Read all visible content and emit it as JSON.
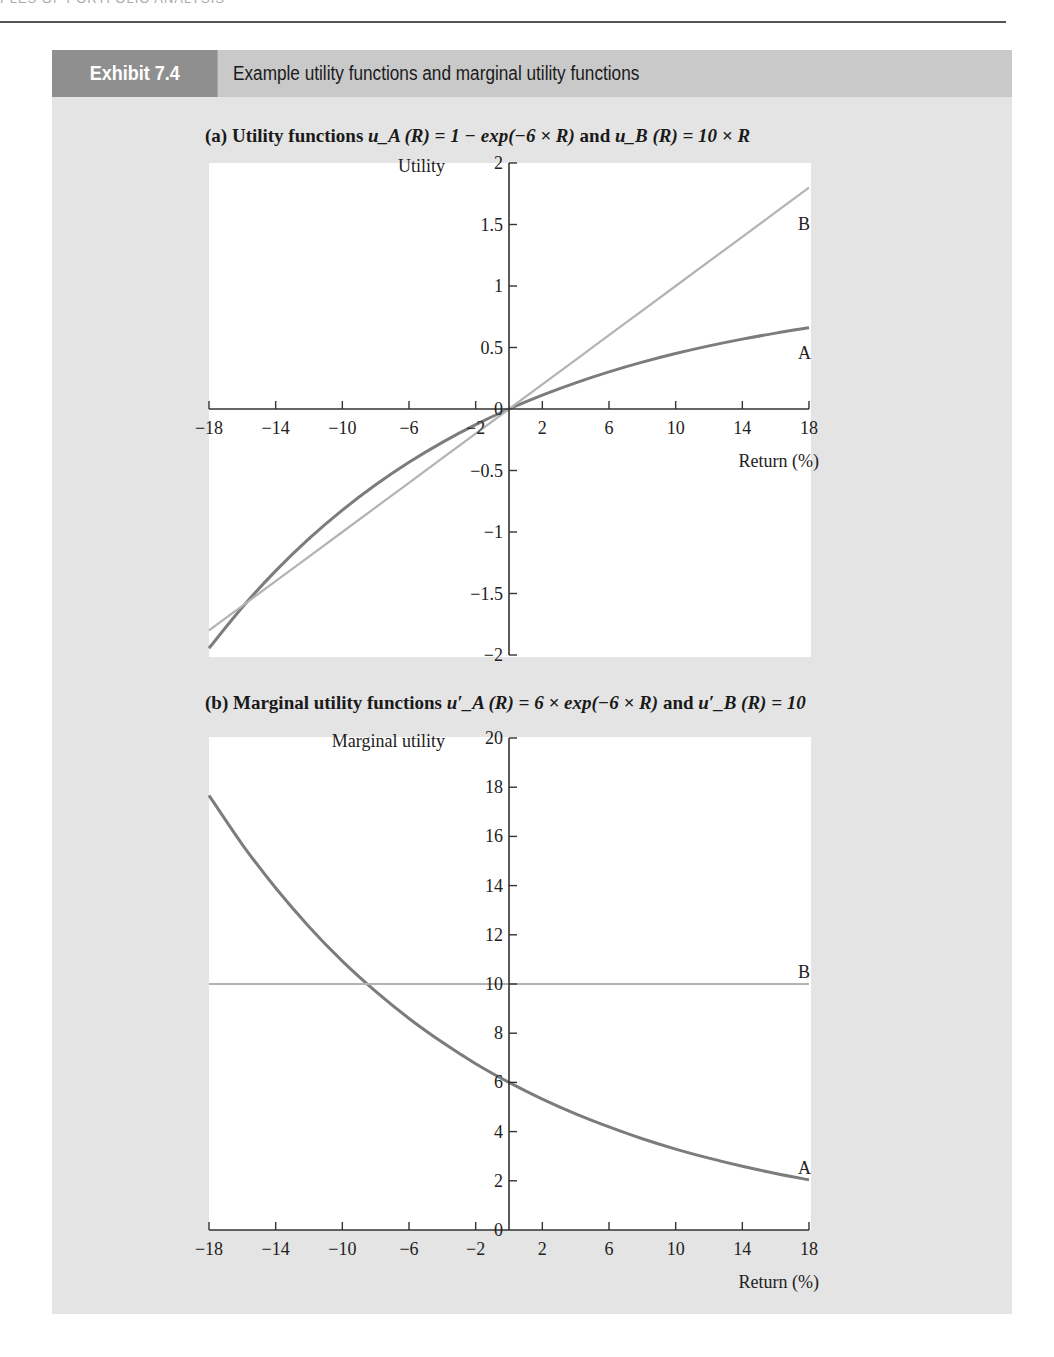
{
  "page": {
    "running_header": "PLES OF PORTFOLIO ANALYSIS"
  },
  "exhibit": {
    "label": "Exhibit 7.4",
    "title": "Example utility functions and marginal utility functions"
  },
  "colors": {
    "exhibit_label_bg": "#8f8f8f",
    "exhibit_title_bg": "#c9c9c9",
    "exhibit_body_bg": "#e4e4e4",
    "series_A": "#7c7c7c",
    "series_B": "#b3b3b3",
    "axis": "#333333"
  },
  "panels": {
    "a": {
      "prefix": "(a)",
      "title_text": "Utility functions",
      "formula_A": "u_A (R) = 1 − exp(−6 × R)",
      "joiner": "and",
      "formula_B": "u_B (R) = 10 × R"
    },
    "b": {
      "prefix": "(b)",
      "title_text": "Marginal utility functions",
      "formula_A": "u′_A (R) = 6 × exp(−6 × R)",
      "joiner": "and",
      "formula_B": "u′_B (R) = 10"
    }
  },
  "chart_data": [
    {
      "id": "a",
      "type": "line",
      "title": "(a) Utility functions u_A(R) = 1 − exp(−6 × R) and u_B(R) = 10 × R",
      "xlabel": "Return (%)",
      "ylabel": "Utility",
      "xlim": [
        -18,
        18
      ],
      "ylim": [
        -2,
        2
      ],
      "xticks": [
        -18,
        -14,
        -10,
        -6,
        -2,
        2,
        6,
        10,
        14,
        18
      ],
      "yticks": [
        -2,
        -1.5,
        -1,
        -0.5,
        0,
        0.5,
        1,
        1.5,
        2
      ],
      "ytick_labels": [
        "−2",
        "−1.5",
        "−1",
        "−0.5",
        "0",
        "0.5",
        "1",
        "1.5",
        "2"
      ],
      "xtick_labels": [
        "−18",
        "−14",
        "−10",
        "−6",
        "−2",
        "2",
        "6",
        "10",
        "14",
        "18"
      ],
      "grid": false,
      "x": [
        -18,
        -16,
        -14,
        -12,
        -10,
        -8,
        -6,
        -4,
        -2,
        0,
        2,
        4,
        6,
        8,
        10,
        12,
        14,
        16,
        18
      ],
      "series": [
        {
          "name": "A",
          "label": "A",
          "values": [
            -1.945,
            -1.612,
            -1.316,
            -1.054,
            -0.822,
            -0.616,
            -0.433,
            -0.271,
            -0.127,
            0,
            0.113,
            0.213,
            0.302,
            0.381,
            0.451,
            0.513,
            0.568,
            0.617,
            0.66
          ]
        },
        {
          "name": "B",
          "label": "B",
          "values": [
            -1.8,
            -1.6,
            -1.4,
            -1.2,
            -1.0,
            -0.8,
            -0.6,
            -0.4,
            -0.2,
            0,
            0.2,
            0.4,
            0.6,
            0.8,
            1.0,
            1.2,
            1.4,
            1.6,
            1.8
          ]
        }
      ]
    },
    {
      "id": "b",
      "type": "line",
      "title": "(b) Marginal utility functions u′_A(R) = 6 × exp(−6 × R) and u′_B(R) = 10",
      "xlabel": "Return (%)",
      "ylabel": "Marginal utility",
      "xlim": [
        -18,
        18
      ],
      "ylim": [
        0,
        20
      ],
      "xticks": [
        -18,
        -14,
        -10,
        -6,
        -2,
        2,
        6,
        10,
        14,
        18
      ],
      "yticks": [
        0,
        2,
        4,
        6,
        8,
        10,
        12,
        14,
        16,
        18,
        20
      ],
      "ytick_labels": [
        "0",
        "2",
        "4",
        "6",
        "8",
        "10",
        "12",
        "14",
        "16",
        "18",
        "20"
      ],
      "xtick_labels": [
        "−18",
        "−14",
        "−10",
        "−6",
        "−2",
        "2",
        "6",
        "10",
        "14",
        "18"
      ],
      "grid": false,
      "x": [
        -18,
        -16,
        -14,
        -12,
        -10,
        -8,
        -6,
        -4,
        -2,
        0,
        2,
        4,
        6,
        8,
        10,
        12,
        14,
        16,
        18
      ],
      "series": [
        {
          "name": "A",
          "label": "A",
          "values": [
            17.67,
            15.67,
            13.9,
            12.33,
            10.93,
            9.7,
            8.6,
            7.63,
            6.76,
            6.0,
            5.32,
            4.72,
            4.19,
            3.71,
            3.29,
            2.92,
            2.59,
            2.3,
            2.04
          ]
        },
        {
          "name": "B",
          "label": "B",
          "values": [
            10,
            10,
            10,
            10,
            10,
            10,
            10,
            10,
            10,
            10,
            10,
            10,
            10,
            10,
            10,
            10,
            10,
            10,
            10
          ]
        }
      ]
    }
  ]
}
